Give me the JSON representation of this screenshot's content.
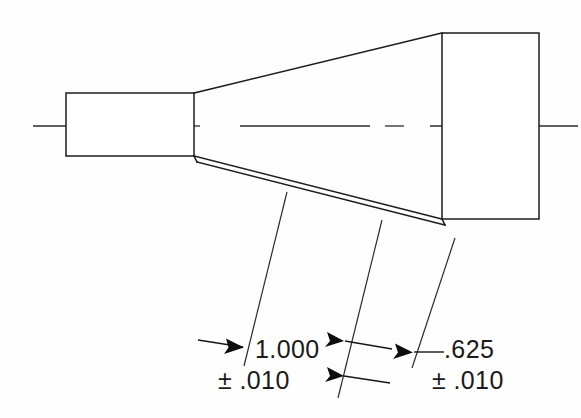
{
  "drawing": {
    "type": "engineering-part-drawing",
    "background_color": "#fefefe",
    "line_color": "#1d1d1d",
    "title": "",
    "part_description": "Tapered shank part shown in side elevation with two linear dimensions",
    "dimensions": [
      {
        "id": "dim-1",
        "nominal": "1.000",
        "tolerance": "± .010",
        "tolerance_symbol": "±",
        "tolerance_value": ".010",
        "label_x": 255,
        "label_y": 358,
        "tol_x": 218,
        "tol_y": 389
      },
      {
        "id": "dim-2",
        "nominal": ".625",
        "tolerance": "± .010",
        "tolerance_symbol": "±",
        "tolerance_value": ".010",
        "label_x": 444,
        "label_y": 358,
        "tol_x": 432,
        "tol_y": 389
      }
    ],
    "geometry": {
      "small_rect": {
        "x": 66,
        "y": 93,
        "width": 128,
        "height": 63
      },
      "large_rect": {
        "x": 442,
        "y": 33,
        "width": 97,
        "height": 186
      },
      "upper_taper": {
        "x1": 194,
        "y1": 93,
        "x2": 442,
        "y2": 33
      },
      "lower_taper": {
        "x1": 194,
        "y1": 156,
        "x2": 442,
        "y2": 219
      },
      "centerline": {
        "x1": 33,
        "y1": 126,
        "x2": 578,
        "y2": 126
      }
    }
  }
}
